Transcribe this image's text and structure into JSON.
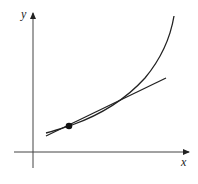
{
  "diagram": {
    "type": "function-tangent-line",
    "axes": {
      "x_label": "x",
      "y_label": "y"
    },
    "elements": [
      {
        "kind": "curve",
        "description": "increasing convex curve"
      },
      {
        "kind": "tangent-line",
        "description": "tangent line to the curve at the marked point"
      },
      {
        "kind": "point",
        "description": "point of tangency"
      }
    ],
    "colors": {
      "stroke": "#222222",
      "axis": "#444444",
      "background": "#ffffff"
    }
  }
}
